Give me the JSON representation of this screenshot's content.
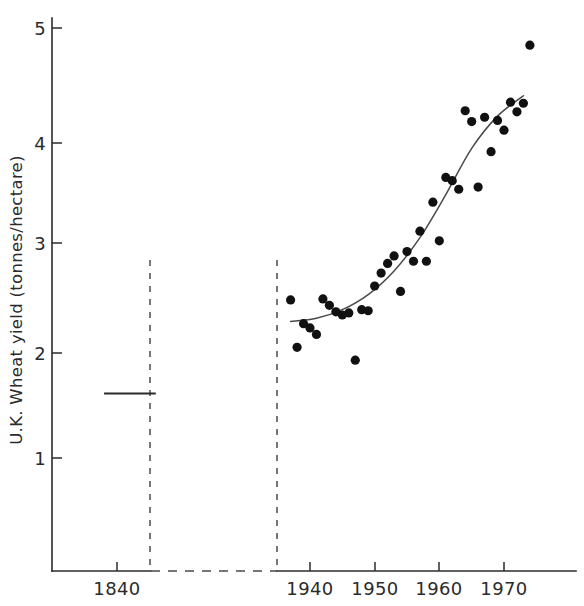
{
  "chart_data": {
    "type": "scatter",
    "title": "",
    "subtitle": "",
    "xlabel": "",
    "ylabel": "U.K. Wheat yield (tonnes/hectare)",
    "xlim": [
      1833,
      1974
    ],
    "ylim": [
      0.0,
      5.2
    ],
    "grid": false,
    "legend": null,
    "axis_break": {
      "present": true,
      "description": "Broken x-axis between the 1840s segment and the modern series",
      "left_segment_end": 1845,
      "right_segment_start": 1935
    },
    "xticks": [
      1840,
      1940,
      1950,
      1960,
      1970
    ],
    "xtick_labels": [
      "1840",
      "1940",
      "1950",
      "1960",
      "1970"
    ],
    "yticks": [
      1,
      2,
      3,
      4,
      5
    ],
    "ytick_labels": [
      "1",
      "2",
      "3",
      "4",
      "5"
    ],
    "series": [
      {
        "name": "1840s mean yield",
        "type": "line",
        "style": "solid-horizontal-segment",
        "x": [
          1838,
          1846
        ],
        "values": [
          1.6,
          1.6
        ]
      },
      {
        "name": "Annual U.K. wheat yield",
        "type": "scatter",
        "marker": "filled-circle",
        "points": [
          {
            "x": 1937,
            "y": 2.47
          },
          {
            "x": 1938,
            "y": 2.03
          },
          {
            "x": 1939,
            "y": 2.25
          },
          {
            "x": 1940,
            "y": 2.21
          },
          {
            "x": 1941,
            "y": 2.15
          },
          {
            "x": 1942,
            "y": 2.48
          },
          {
            "x": 1943,
            "y": 2.42
          },
          {
            "x": 1944,
            "y": 2.36
          },
          {
            "x": 1945,
            "y": 2.33
          },
          {
            "x": 1946,
            "y": 2.35
          },
          {
            "x": 1947,
            "y": 1.91
          },
          {
            "x": 1948,
            "y": 2.38
          },
          {
            "x": 1949,
            "y": 2.37
          },
          {
            "x": 1950,
            "y": 2.6
          },
          {
            "x": 1951,
            "y": 2.72
          },
          {
            "x": 1952,
            "y": 2.81
          },
          {
            "x": 1953,
            "y": 2.88
          },
          {
            "x": 1954,
            "y": 2.55
          },
          {
            "x": 1955,
            "y": 2.92
          },
          {
            "x": 1956,
            "y": 2.83
          },
          {
            "x": 1957,
            "y": 3.11
          },
          {
            "x": 1958,
            "y": 2.83
          },
          {
            "x": 1959,
            "y": 3.38
          },
          {
            "x": 1960,
            "y": 3.02
          },
          {
            "x": 1961,
            "y": 3.61
          },
          {
            "x": 1962,
            "y": 3.58
          },
          {
            "x": 1963,
            "y": 3.5
          },
          {
            "x": 1964,
            "y": 4.23
          },
          {
            "x": 1965,
            "y": 4.13
          },
          {
            "x": 1966,
            "y": 3.52
          },
          {
            "x": 1967,
            "y": 4.17
          },
          {
            "x": 1968,
            "y": 3.85
          },
          {
            "x": 1969,
            "y": 4.14
          },
          {
            "x": 1970,
            "y": 4.05
          },
          {
            "x": 1971,
            "y": 4.31
          },
          {
            "x": 1972,
            "y": 4.22
          },
          {
            "x": 1973,
            "y": 4.3
          },
          {
            "x": 1974,
            "y": 4.84
          }
        ]
      },
      {
        "name": "Fitted trend curve",
        "type": "line",
        "style": "smooth-sigmoid",
        "x": [
          1937,
          1941,
          1945,
          1949,
          1953,
          1957,
          1961,
          1965,
          1969,
          1973
        ],
        "values": [
          2.27,
          2.3,
          2.38,
          2.52,
          2.74,
          3.05,
          3.45,
          3.88,
          4.18,
          4.37
        ]
      }
    ],
    "annotations": []
  },
  "axes": {
    "y_title": "U.K. Wheat yield (tonnes/hectare)"
  }
}
